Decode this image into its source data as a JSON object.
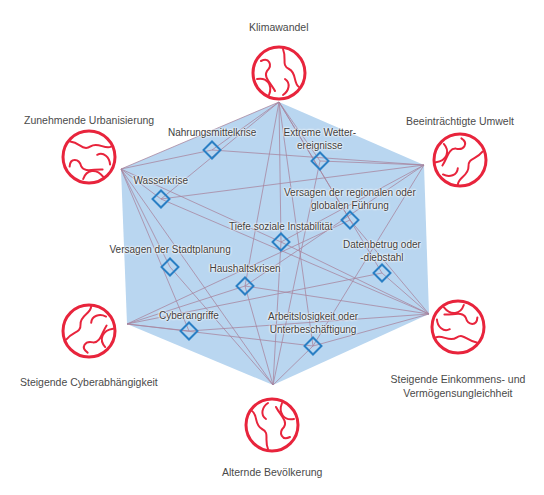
{
  "colors": {
    "hexagon_fill": "#b9d6f0",
    "connection_line": "#a8849e",
    "risk_node": "#2a7fc4",
    "trend_globe": "#e8243c",
    "label_text": "#444444"
  },
  "hexagon": {
    "vertices": [
      [
        279,
        102
      ],
      [
        424,
        165
      ],
      [
        429,
        314
      ],
      [
        273,
        385
      ],
      [
        127,
        324
      ],
      [
        121,
        169
      ]
    ]
  },
  "trends": [
    {
      "id": "klimawandel",
      "label_lines": [
        "Klimawandel"
      ],
      "globe": [
        279,
        73
      ],
      "vertex": [
        279,
        102
      ],
      "label_pos": [
        279,
        20
      ]
    },
    {
      "id": "beeintraechtigte-umwelt",
      "label_lines": [
        "Beeinträchtigte Umwelt"
      ],
      "globe": [
        460,
        160
      ],
      "vertex": [
        424,
        165
      ],
      "label_pos": [
        460,
        114
      ]
    },
    {
      "id": "steigende-ungleichheit",
      "label_lines": [
        "Steigende Einkommens- und",
        "Vermögensungleichheit"
      ],
      "globe": [
        458,
        327
      ],
      "vertex": [
        429,
        314
      ],
      "label_pos": [
        458,
        372
      ]
    },
    {
      "id": "alternde-bevoelkerung",
      "label_lines": [
        "Alternde Bevölkerung"
      ],
      "globe": [
        272,
        425
      ],
      "vertex": [
        273,
        385
      ],
      "label_pos": [
        272,
        465
      ]
    },
    {
      "id": "steigende-cyberabhaengigkeit",
      "label_lines": [
        "Steigende Cyberabhängigkeit"
      ],
      "globe": [
        89,
        331
      ],
      "vertex": [
        127,
        324
      ],
      "label_pos": [
        89,
        375
      ]
    },
    {
      "id": "zunehmende-urbanisierung",
      "label_lines": [
        "Zunehmende Urbanisierung"
      ],
      "globe": [
        89,
        157
      ],
      "vertex": [
        121,
        169
      ],
      "label_pos": [
        89,
        113
      ]
    }
  ],
  "risks": [
    {
      "id": "nahrungsmittelkrise",
      "label_lines": [
        "Nahrungsmittelkrise"
      ],
      "node": [
        212,
        150
      ],
      "label_pos": [
        212,
        126
      ]
    },
    {
      "id": "extreme-wetterereignisse",
      "label_lines": [
        "Extreme Wetter-",
        "ereignisse"
      ],
      "node": [
        320,
        161
      ],
      "label_pos": [
        320,
        126
      ]
    },
    {
      "id": "wasserkrise",
      "label_lines": [
        "Wasserkrise"
      ],
      "node": [
        161,
        199
      ],
      "label_pos": [
        161,
        174
      ]
    },
    {
      "id": "versagen-regionale-globale-fuehrung",
      "label_lines": [
        "Versagen der regionalen oder",
        "globalen Führung"
      ],
      "node": [
        350,
        220
      ],
      "label_pos": [
        350,
        186
      ]
    },
    {
      "id": "tiefe-soziale-instabilitaet",
      "label_lines": [
        "Tiefe soziale Instabilität"
      ],
      "node": [
        281,
        242
      ],
      "label_pos": [
        281,
        220
      ]
    },
    {
      "id": "versagen-stadtplanung",
      "label_lines": [
        "Versagen der Stadtplanung"
      ],
      "node": [
        170,
        267
      ],
      "label_pos": [
        170,
        243
      ]
    },
    {
      "id": "datenbetrug-diebstahl",
      "label_lines": [
        "Datenbetrug oder",
        "-diebstahl"
      ],
      "node": [
        382,
        273
      ],
      "label_pos": [
        382,
        238
      ]
    },
    {
      "id": "haushaltskrisen",
      "label_lines": [
        "Haushaltskrisen"
      ],
      "node": [
        245,
        286
      ],
      "label_pos": [
        245,
        262
      ]
    },
    {
      "id": "cyberangriffe",
      "label_lines": [
        "Cyberangriffe"
      ],
      "node": [
        189,
        331
      ],
      "label_pos": [
        189,
        309
      ]
    },
    {
      "id": "arbeitslosigkeit-unterbeschaeftigung",
      "label_lines": [
        "Arbeitslosigkeit oder",
        "Unterbeschäftigung"
      ],
      "node": [
        313,
        346
      ],
      "label_pos": [
        313,
        310
      ]
    }
  ],
  "connections": [
    [
      "klimawandel",
      "nahrungsmittelkrise"
    ],
    [
      "klimawandel",
      "extreme-wetterereignisse"
    ],
    [
      "klimawandel",
      "wasserkrise"
    ],
    [
      "klimawandel",
      "versagen-regionale-globale-fuehrung"
    ],
    [
      "klimawandel",
      "tiefe-soziale-instabilitaet"
    ],
    [
      "klimawandel",
      "haushaltskrisen"
    ],
    [
      "klimawandel",
      "arbeitslosigkeit-unterbeschaeftigung"
    ],
    [
      "klimawandel",
      "datenbetrug-diebstahl"
    ],
    [
      "klimawandel",
      "zunehmende-urbanisierung"
    ],
    [
      "beeintraechtigte-umwelt",
      "nahrungsmittelkrise"
    ],
    [
      "beeintraechtigte-umwelt",
      "extreme-wetterereignisse"
    ],
    [
      "beeintraechtigte-umwelt",
      "wasserkrise"
    ],
    [
      "beeintraechtigte-umwelt",
      "tiefe-soziale-instabilitaet"
    ],
    [
      "beeintraechtigte-umwelt",
      "haushaltskrisen"
    ],
    [
      "beeintraechtigte-umwelt",
      "arbeitslosigkeit-unterbeschaeftigung"
    ],
    [
      "steigende-ungleichheit",
      "tiefe-soziale-instabilitaet"
    ],
    [
      "steigende-ungleichheit",
      "haushaltskrisen"
    ],
    [
      "steigende-ungleichheit",
      "datenbetrug-diebstahl"
    ],
    [
      "steigende-ungleichheit",
      "arbeitslosigkeit-unterbeschaeftigung"
    ],
    [
      "steigende-ungleichheit",
      "wasserkrise"
    ],
    [
      "steigende-ungleichheit",
      "versagen-regionale-globale-fuehrung"
    ],
    [
      "steigende-ungleichheit",
      "cyberangriffe"
    ],
    [
      "alternde-bevoelkerung",
      "haushaltskrisen"
    ],
    [
      "alternde-bevoelkerung",
      "arbeitslosigkeit-unterbeschaeftigung"
    ],
    [
      "alternde-bevoelkerung",
      "versagen-stadtplanung"
    ],
    [
      "alternde-bevoelkerung",
      "tiefe-soziale-instabilitaet"
    ],
    [
      "alternde-bevoelkerung",
      "zunehmende-urbanisierung"
    ],
    [
      "alternde-bevoelkerung",
      "extreme-wetterereignisse"
    ],
    [
      "steigende-cyberabhaengigkeit",
      "cyberangriffe"
    ],
    [
      "steigende-cyberabhaengigkeit",
      "datenbetrug-diebstahl"
    ],
    [
      "steigende-cyberabhaengigkeit",
      "haushaltskrisen"
    ],
    [
      "steigende-cyberabhaengigkeit",
      "versagen-regionale-globale-fuehrung"
    ],
    [
      "steigende-cyberabhaengigkeit",
      "arbeitslosigkeit-unterbeschaeftigung"
    ],
    [
      "zunehmende-urbanisierung",
      "nahrungsmittelkrise"
    ],
    [
      "zunehmende-urbanisierung",
      "wasserkrise"
    ],
    [
      "zunehmende-urbanisierung",
      "versagen-stadtplanung"
    ],
    [
      "zunehmende-urbanisierung",
      "tiefe-soziale-instabilitaet"
    ],
    [
      "zunehmende-urbanisierung",
      "cyberangriffe"
    ]
  ]
}
